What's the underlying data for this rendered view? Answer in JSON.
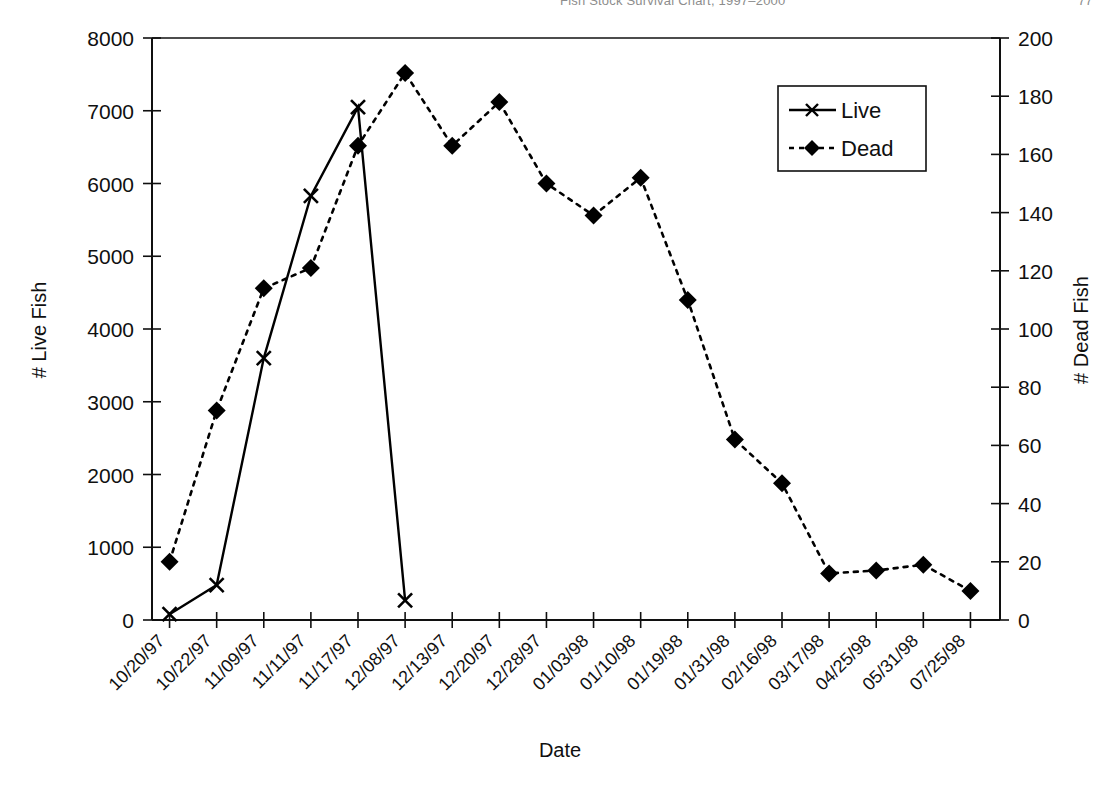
{
  "running_head": {
    "title": "Fish Stock Survival Chart, 1997–2000",
    "page_number": "77"
  },
  "chart_data": {
    "type": "line",
    "title": "",
    "xlabel": "Date",
    "ylabel": "# Live Fish",
    "y2label": "# Dead Fish",
    "grid": false,
    "legend_position": "top-right",
    "categories": [
      "10/20/97",
      "10/22/97",
      "11/09/97",
      "11/11/97",
      "11/17/97",
      "12/08/97",
      "12/13/97",
      "12/20/97",
      "12/28/97",
      "01/03/98",
      "01/10/98",
      "01/19/98",
      "01/31/98",
      "02/16/98",
      "03/17/98",
      "04/25/98",
      "05/31/98",
      "07/25/98"
    ],
    "ylim": [
      0,
      8000
    ],
    "yticks": [
      0,
      1000,
      2000,
      3000,
      4000,
      5000,
      6000,
      7000,
      8000
    ],
    "y2lim": [
      0,
      200
    ],
    "y2ticks": [
      0,
      20,
      40,
      60,
      80,
      100,
      120,
      140,
      160,
      180,
      200
    ],
    "series": [
      {
        "name": "Live",
        "axis": "left",
        "marker": "x",
        "linestyle": "solid",
        "color": "#000000",
        "values": [
          80,
          480,
          3600,
          5830,
          7050,
          270,
          null,
          null,
          null,
          null,
          null,
          null,
          null,
          null,
          null,
          null,
          null,
          null
        ],
        "x_offsets": [
          0,
          1,
          2,
          3,
          4,
          5,
          5.8
        ]
      },
      {
        "name": "Dead",
        "axis": "right",
        "marker": "diamond",
        "linestyle": "dotted",
        "color": "#000000",
        "values": [
          20,
          72,
          114,
          121,
          163,
          188,
          163,
          178,
          150,
          139,
          152,
          110,
          62,
          47,
          16,
          17,
          19,
          10
        ]
      }
    ],
    "series_dead_tail_note": "",
    "legend": [
      "Live",
      "Dead"
    ]
  },
  "legend": {
    "items": [
      {
        "label": "Live",
        "marker": "x-marker",
        "style": "solid"
      },
      {
        "label": "Dead",
        "marker": "diamond-marker",
        "style": "dotted"
      }
    ]
  }
}
